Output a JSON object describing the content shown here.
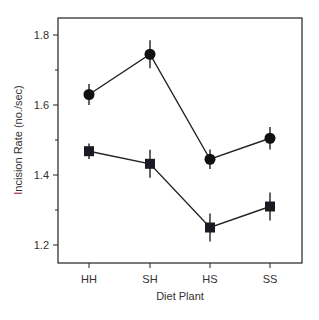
{
  "chart_data": {
    "type": "line",
    "title": "",
    "xlabel": "Diet Plant",
    "ylabel": "Incision Rate  (no./sec)",
    "ylabel_first_letter_color": "#8b2a2a",
    "categories": [
      "HH",
      "SH",
      "HS",
      "SS"
    ],
    "ylim": [
      1.15,
      1.85
    ],
    "yticks": [
      1.2,
      1.4,
      1.6,
      1.8
    ],
    "yminor_ticks": [
      1.3,
      1.5,
      1.7
    ],
    "grid": false,
    "legend": null,
    "series": [
      {
        "name": "circles",
        "marker": "circle",
        "values": [
          1.63,
          1.745,
          1.445,
          1.505
        ],
        "errors": [
          0.03,
          0.04,
          0.028,
          0.032
        ]
      },
      {
        "name": "squares",
        "marker": "square",
        "values": [
          1.468,
          1.432,
          1.25,
          1.31
        ],
        "errors": [
          0.022,
          0.04,
          0.04,
          0.04
        ]
      }
    ]
  }
}
